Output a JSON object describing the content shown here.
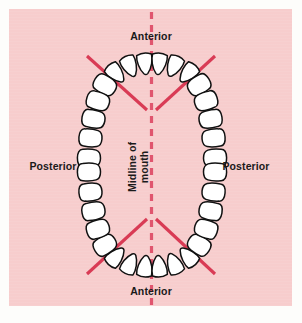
{
  "figure": {
    "type": "dental-arch-diagram",
    "title_visible": false,
    "labels": {
      "anterior_top": "Anterior",
      "anterior_bottom": "Anterior",
      "posterior_left": "Posterior",
      "posterior_right": "Posterior",
      "midline_line1": "Midline of",
      "midline_line2": "mouth"
    },
    "colors": {
      "panel_background": "#f7cdcd",
      "outer_background": "#fdfdfb",
      "divider_line": "#d93b55",
      "midline_dash": "#e0556e",
      "tooth_fill": "#ffffff",
      "tooth_outline": "#111111",
      "label_text": "#1a1a1a"
    },
    "elements": {
      "midline": {
        "orientation": "vertical",
        "style": "dashed",
        "x": 151,
        "y_start": 14,
        "y_end": 305
      },
      "divider_lines": [
        {
          "name": "upper-left-divider",
          "x1": 88,
          "y1": 58,
          "x2": 146,
          "y2": 110
        },
        {
          "name": "upper-right-divider",
          "x1": 214,
          "y1": 58,
          "x2": 157,
          "y2": 110
        },
        {
          "name": "lower-left-divider",
          "x1": 88,
          "y1": 272,
          "x2": 146,
          "y2": 219
        },
        {
          "name": "lower-right-divider",
          "x1": 214,
          "y1": 272,
          "x2": 157,
          "y2": 219
        }
      ],
      "arch": {
        "center_x": 151,
        "center_y": 165,
        "radius_x": 63,
        "radius_y": 108,
        "anterior_tooth_shape": "pointed-incisor",
        "posterior_tooth_shape": "rounded-molar"
      }
    },
    "teeth": {
      "upper_arch": {
        "anterior_count": 6,
        "posterior_left_count": 5,
        "posterior_right_count": 5
      },
      "lower_arch": {
        "anterior_count": 6,
        "posterior_left_count": 5,
        "posterior_right_count": 5
      },
      "total_visible": 32
    }
  }
}
